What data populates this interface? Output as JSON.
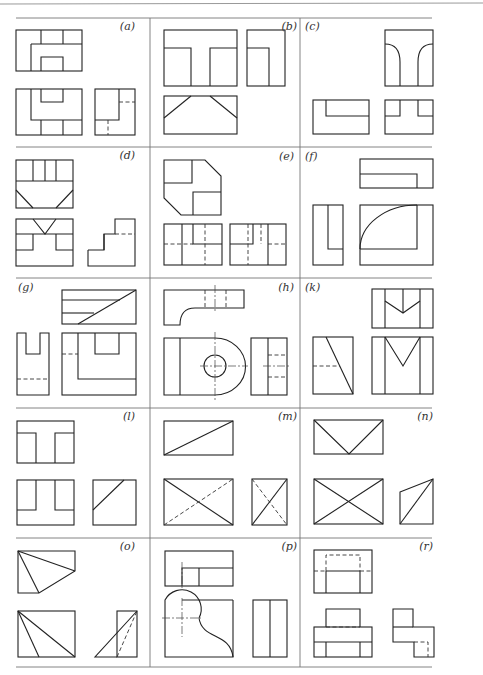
{
  "page": {
    "type": "orthographic-projection-exercises",
    "layout": {
      "rows": 5,
      "columns": 3
    },
    "colors": {
      "line": "#222222",
      "rule": "#777777",
      "background": "#ffffff"
    }
  },
  "panels": [
    {
      "id": "a",
      "label": "(a)",
      "views": [
        "front",
        "top",
        "side"
      ],
      "description": "U-channel block with three-segment top strip"
    },
    {
      "id": "b",
      "label": "(b)",
      "views": [
        "front",
        "side",
        "top"
      ],
      "description": "T-shaped block with chamfered bottom view"
    },
    {
      "id": "c",
      "label": "(c)",
      "views": [
        "side",
        "front",
        "top"
      ],
      "description": "Block with rounded inner fillets"
    },
    {
      "id": "d",
      "label": "(d)",
      "views": [
        "top",
        "front",
        "side"
      ],
      "description": "V-notch block"
    },
    {
      "id": "e",
      "label": "(e)",
      "views": [
        "top",
        "front",
        "side"
      ],
      "description": "Chamfered octagonal block with hidden lines"
    },
    {
      "id": "f",
      "label": "(f)",
      "views": [
        "top",
        "side",
        "front"
      ],
      "description": "L-block with quarter-round arc"
    },
    {
      "id": "g",
      "label": "(g)",
      "views": [
        "label",
        "top",
        "side",
        "front"
      ],
      "description": "Slotted block with inclined face"
    },
    {
      "id": "h",
      "label": "(h)",
      "views": [
        "top",
        "front",
        "side"
      ],
      "description": "Bracket with hole and rounded end"
    },
    {
      "id": "k",
      "label": "(k)",
      "views": [
        "label",
        "top",
        "side",
        "front"
      ],
      "description": "Block with V-groove"
    },
    {
      "id": "l",
      "label": "(l)",
      "views": [
        "top",
        "front",
        "side"
      ],
      "description": "T-slot block with angled face"
    },
    {
      "id": "m",
      "label": "(m)",
      "views": [
        "top",
        "front",
        "side"
      ],
      "description": "Wedge with diagonals"
    },
    {
      "id": "n",
      "label": "(n)",
      "views": [
        "top",
        "front",
        "side"
      ],
      "description": "Pyramid-like with crossing diagonals"
    },
    {
      "id": "o",
      "label": "(o)",
      "views": [
        "top",
        "front",
        "side"
      ],
      "description": "Tetrahedral cut block"
    },
    {
      "id": "p",
      "label": "(p)",
      "views": [
        "top",
        "front",
        "side"
      ],
      "description": "Curved profile block with center lines"
    },
    {
      "id": "r",
      "label": "(r)",
      "views": [
        "top",
        "front",
        "side"
      ],
      "description": "Stepped block with hidden lines"
    }
  ]
}
